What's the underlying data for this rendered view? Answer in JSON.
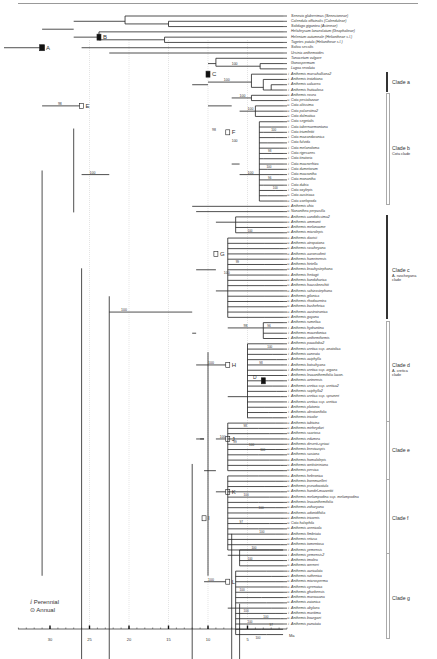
{
  "figure": {
    "type": "phylogenetic chronogram",
    "time_unit": "Ma",
    "axis": {
      "ticks": [
        "30",
        "25",
        "20",
        "15",
        "10",
        "5"
      ],
      "unit_label": "Ma"
    },
    "legend": {
      "perennial": "Perennial",
      "annual": "Annual"
    },
    "node_labels": [
      "A",
      "B",
      "C",
      "D",
      "E",
      "F",
      "G",
      "H",
      "I",
      "J",
      "K",
      "L"
    ],
    "bootstrap_values": [
      "98",
      "100",
      "100",
      "100",
      "100",
      "98",
      "100",
      "100",
      "100",
      "100",
      "98",
      "100",
      "100",
      "100",
      "100",
      "99",
      "98",
      "100",
      "96",
      "100",
      "100",
      "98",
      "100",
      "100",
      "100",
      "100",
      "97",
      "100",
      "100",
      "100",
      "100",
      "100",
      "100",
      "97",
      "100"
    ],
    "clades": [
      {
        "name": "Clade a",
        "sub": ""
      },
      {
        "name": "Clade b",
        "sub": "Cota clade"
      },
      {
        "name": "Clade c",
        "sub1": "A. rascheyana",
        "sub2": "clade"
      },
      {
        "name": "Clade d",
        "sub1": "A. cretica",
        "sub2": "clade"
      },
      {
        "name": "Clade e",
        "sub": ""
      },
      {
        "name": "Clade f",
        "sub": ""
      },
      {
        "name": "Clade g",
        "sub": ""
      }
    ],
    "taxa": [
      {
        "name": "Senecio glaberrimus (Senecioneae)",
        "h": ""
      },
      {
        "name": "Calendula officinalis (Calenduleae)",
        "h": ""
      },
      {
        "name": "Solidago gigantea (Astereae)",
        "h": ""
      },
      {
        "name": "Helichrysum lanceolatum (Gnaphalieae)",
        "h": ""
      },
      {
        "name": "Helenium autumnale (Heliantheae s.l.)",
        "h": ""
      },
      {
        "name": "Tagetes patula (Heliantheae s.l.)",
        "h": ""
      },
      {
        "name": "Soliva sessilis",
        "h": ""
      },
      {
        "name": "Ursinia anthemoides",
        "h": ""
      },
      {
        "name": "Tanacetum vulgare",
        "h": ""
      },
      {
        "name": "Gonospermum",
        "h": ""
      },
      {
        "name": "Lugoa revoluta",
        "h": ""
      },
      {
        "name": "Anthemis marschalliana2",
        "h": "P"
      },
      {
        "name": "Anthemis trotzkiana",
        "h": "P"
      },
      {
        "name": "Anthemis calcarea",
        "h": "P"
      },
      {
        "name": "Anthemis fruticulosa",
        "h": "P"
      },
      {
        "name": "Anthemis rosea",
        "h": "A"
      },
      {
        "name": "Cota pestalozzae",
        "h": "A"
      },
      {
        "name": "Cota altissima",
        "h": "A"
      },
      {
        "name": "Cota palaestina2",
        "h": "A"
      },
      {
        "name": "Cota dalmatica",
        "h": "A"
      },
      {
        "name": "Cota segetalis",
        "h": "A"
      },
      {
        "name": "Cota tabernaemontana",
        "h": "P"
      },
      {
        "name": "Cota triumfettii",
        "h": "P"
      },
      {
        "name": "Cota mazandaranica",
        "h": "P"
      },
      {
        "name": "Cota fulvida",
        "h": "P"
      },
      {
        "name": "Cota melanoloma",
        "h": "P"
      },
      {
        "name": "Cota rigescens",
        "h": "P"
      },
      {
        "name": "Cota tinctoria",
        "h": "P"
      },
      {
        "name": "Cota macrorrhiza",
        "h": "P"
      },
      {
        "name": "Cota dumetorum",
        "h": "P"
      },
      {
        "name": "Cota macrantha",
        "h": "P"
      },
      {
        "name": "Cota monantha",
        "h": "P"
      },
      {
        "name": "Cota dubia",
        "h": "P"
      },
      {
        "name": "Cota oxylepis",
        "h": "P"
      },
      {
        "name": "Cota austriaca",
        "h": "A"
      },
      {
        "name": "Cota coelopoda",
        "h": "A"
      },
      {
        "name": "Anthemis chia",
        "h": "A"
      },
      {
        "name": "Nananthea perpusilla",
        "h": "A"
      },
      {
        "name": "Anthemis candidissima2",
        "h": "A"
      },
      {
        "name": "Anthemis ammanii",
        "h": "A"
      },
      {
        "name": "Anthemis melanacme",
        "h": "A"
      },
      {
        "name": "Anthemis microlepis",
        "h": "A"
      },
      {
        "name": "Anthemis davisii",
        "h": "A"
      },
      {
        "name": "Anthemis atropatana",
        "h": "A"
      },
      {
        "name": "Anthemis rascheyana",
        "h": "A"
      },
      {
        "name": "Anthemis aaronsohnii",
        "h": "A"
      },
      {
        "name": "Anthemis hamrinensis",
        "h": "A"
      },
      {
        "name": "Anthemis hirtella",
        "h": "A"
      },
      {
        "name": "Anthemis brachystephana",
        "h": "A"
      },
      {
        "name": "Anthemis freitagii",
        "h": "A"
      },
      {
        "name": "Anthemis kandaharica",
        "h": "A"
      },
      {
        "name": "Anthemis haussknechtii",
        "h": "A"
      },
      {
        "name": "Anthemis schizostephana",
        "h": "A"
      },
      {
        "name": "Anthemis gilanica",
        "h": "A"
      },
      {
        "name": "Anthemis rhodocentra",
        "h": "A"
      },
      {
        "name": "Anthemis bushehrica",
        "h": "A"
      },
      {
        "name": "Anthemis austroiranica",
        "h": "A"
      },
      {
        "name": "Anthemis gayana",
        "h": "A"
      },
      {
        "name": "Anthemis rumelica",
        "h": "P"
      },
      {
        "name": "Anthemis hydruntina",
        "h": "P"
      },
      {
        "name": "Anthemis macedonica",
        "h": "P"
      },
      {
        "name": "Anthemis anthemiformis",
        "h": "P"
      },
      {
        "name": "Anthemis pauciloba2",
        "h": "P"
      },
      {
        "name": "Anthemis cretica ssp. anatolica",
        "h": "P"
      },
      {
        "name": "Anthemis cuneata",
        "h": "P"
      },
      {
        "name": "Anthemis aciphylla",
        "h": "P"
      },
      {
        "name": "Anthemis kotschyana",
        "h": "P"
      },
      {
        "name": "Anthemis cretica ssp. argaea",
        "h": "P"
      },
      {
        "name": "Anthemis leucanthemifolia lacon.",
        "h": "P"
      },
      {
        "name": "Anthemis aetnensis",
        "h": "P"
      },
      {
        "name": "Anthemis cretica ssp. cretica2",
        "h": "P"
      },
      {
        "name": "Anthemis sciphylla2",
        "h": "P"
      },
      {
        "name": "Anthemis cretica ssp. spruneri",
        "h": "P"
      },
      {
        "name": "Anthemis cretica ssp. cretica",
        "h": "P"
      },
      {
        "name": "Anthemis plutonia",
        "h": "P"
      },
      {
        "name": "Anthemis abrotanifolia",
        "h": "P"
      },
      {
        "name": "Anthemis tricolor",
        "h": "P"
      },
      {
        "name": "Anthemis tubicina",
        "h": "A"
      },
      {
        "name": "Anthemis mirheydari",
        "h": "A"
      },
      {
        "name": "Anthemis scariosa",
        "h": "A"
      },
      {
        "name": "Anthemis edumea",
        "h": "A"
      },
      {
        "name": "Anthemis deserti-syriaci",
        "h": "A"
      },
      {
        "name": "Anthemis brevicuspis",
        "h": "A"
      },
      {
        "name": "Anthemis susiana",
        "h": "A"
      },
      {
        "name": "Anthemis homalolepis",
        "h": "A"
      },
      {
        "name": "Anthemis wettsteiniana",
        "h": "A"
      },
      {
        "name": "Anthemis persica",
        "h": "A"
      },
      {
        "name": "Anthemis hebronica",
        "h": "A"
      },
      {
        "name": "Anthemis bornmuelleri",
        "h": "A"
      },
      {
        "name": "Anthemis pseudocotula",
        "h": "A"
      },
      {
        "name": "Anthemis handel-mazzettii",
        "h": "A"
      },
      {
        "name": "Anthemis melampodina ssp. melampodina",
        "h": "A"
      },
      {
        "name": "Anthemis leucanthemifolia",
        "h": "A"
      },
      {
        "name": "Anthemis zoharyana",
        "h": "A"
      },
      {
        "name": "Anthemis adonidifolia",
        "h": "A"
      },
      {
        "name": "Anthemis tricornis",
        "h": "A"
      },
      {
        "name": "Cota halophila",
        "h": "A"
      },
      {
        "name": "Anthemis arenicola",
        "h": "A"
      },
      {
        "name": "Anthemis fimbriata",
        "h": "A"
      },
      {
        "name": "Anthemis retusa",
        "h": "A"
      },
      {
        "name": "Anthemis tomentosa",
        "h": "A"
      },
      {
        "name": "Anthemis yemensis",
        "h": "P"
      },
      {
        "name": "Anthemis yemensis2",
        "h": "P"
      },
      {
        "name": "Anthemis tmolea",
        "h": "P"
      },
      {
        "name": "Anthemis werneri",
        "h": "A"
      },
      {
        "name": "Anthemis auriculata",
        "h": "A"
      },
      {
        "name": "Anthemis ruthenica",
        "h": "A"
      },
      {
        "name": "Anthemis microsperma",
        "h": "A"
      },
      {
        "name": "Anthemis cyrenaica",
        "h": "A"
      },
      {
        "name": "Anthemis gharbensis",
        "h": "A"
      },
      {
        "name": "Anthemis maroccana",
        "h": "A"
      },
      {
        "name": "Anthemis zaianica",
        "h": "A"
      },
      {
        "name": "Anthemis abylaea",
        "h": "P"
      },
      {
        "name": "Anthemis maritima",
        "h": "P"
      },
      {
        "name": "Anthemis bourgaei",
        "h": "A"
      },
      {
        "name": "Anthemis punctata",
        "h": "P"
      }
    ]
  }
}
